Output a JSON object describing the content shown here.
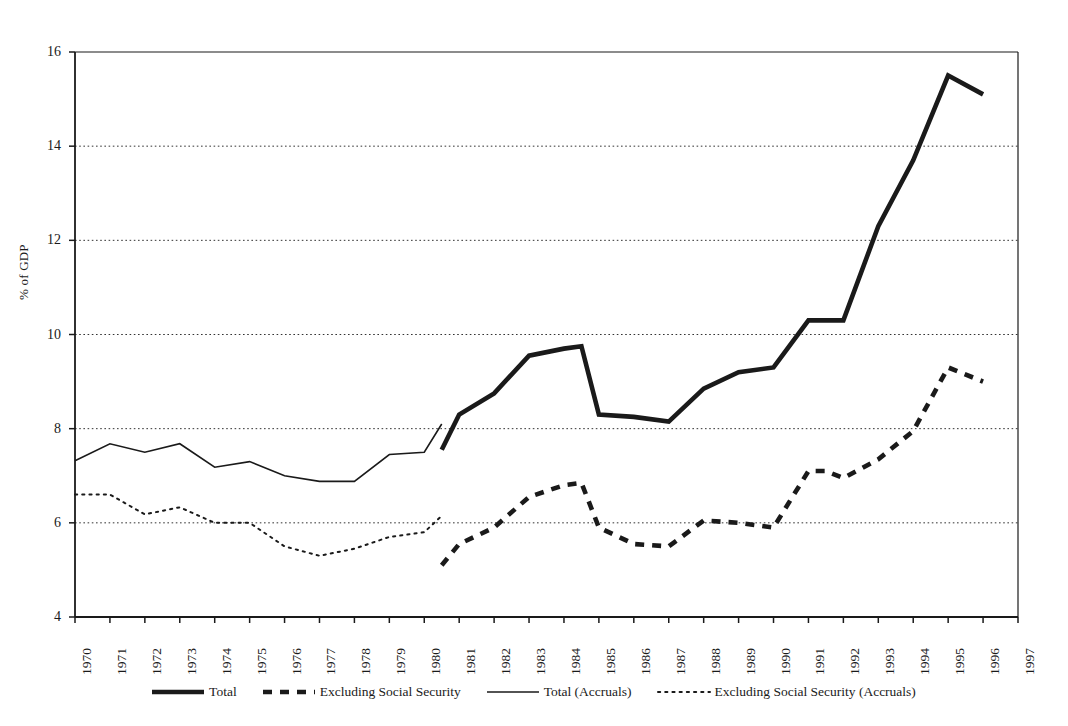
{
  "chart_data": {
    "type": "line",
    "title": "",
    "xlabel": "",
    "ylabel": "% of GDP",
    "xlim": [
      1970,
      1997
    ],
    "ylim": [
      4,
      16
    ],
    "yticks": [
      4,
      6,
      8,
      10,
      12,
      14,
      16
    ],
    "xticks": [
      1970,
      1971,
      1972,
      1973,
      1974,
      1975,
      1976,
      1977,
      1978,
      1979,
      1980,
      1981,
      1982,
      1983,
      1984,
      1985,
      1986,
      1987,
      1988,
      1989,
      1990,
      1991,
      1992,
      1993,
      1994,
      1995,
      1996,
      1997
    ],
    "grid": "horizontal-dotted",
    "legend_position": "bottom",
    "series": [
      {
        "name": "Total",
        "style": "thick-solid",
        "color": "#1a1a1a",
        "x": [
          1980.5,
          1981,
          1982,
          1983,
          1984,
          1984.5,
          1985,
          1986,
          1987,
          1988,
          1989,
          1990,
          1991,
          1991.5,
          1992,
          1993,
          1994,
          1995,
          1996
        ],
        "y": [
          7.55,
          8.3,
          8.75,
          9.55,
          9.7,
          9.75,
          8.3,
          8.25,
          8.15,
          8.85,
          9.2,
          9.3,
          10.3,
          10.3,
          10.3,
          12.3,
          13.7,
          15.5,
          15.1
        ]
      },
      {
        "name": "Excluding Social Security",
        "style": "thick-dashed",
        "color": "#1a1a1a",
        "x": [
          1980.5,
          1981,
          1982,
          1983,
          1984,
          1984.5,
          1985,
          1986,
          1987,
          1988,
          1989,
          1990,
          1991,
          1991.5,
          1992,
          1993,
          1994,
          1995,
          1996
        ],
        "y": [
          5.1,
          5.55,
          5.9,
          6.55,
          6.8,
          6.85,
          5.9,
          5.55,
          5.5,
          6.05,
          6.0,
          5.9,
          7.1,
          7.1,
          6.95,
          7.35,
          7.95,
          9.3,
          9.0
        ]
      },
      {
        "name": "Total (Accruals)",
        "style": "thin-solid",
        "color": "#1a1a1a",
        "x": [
          1970,
          1971,
          1972,
          1973,
          1974,
          1975,
          1976,
          1977,
          1978,
          1979,
          1980,
          1980.5
        ],
        "y": [
          7.32,
          7.68,
          7.5,
          7.68,
          7.18,
          7.3,
          7.0,
          6.88,
          6.88,
          7.45,
          7.5,
          8.1
        ]
      },
      {
        "name": "Excluding Social Security (Accruals)",
        "style": "thin-dotted",
        "color": "#1a1a1a",
        "x": [
          1970,
          1971,
          1972,
          1973,
          1974,
          1975,
          1976,
          1977,
          1978,
          1979,
          1980,
          1980.5
        ],
        "y": [
          6.6,
          6.6,
          6.18,
          6.33,
          6.0,
          6.0,
          5.5,
          5.3,
          5.45,
          5.7,
          5.8,
          6.15
        ]
      }
    ]
  },
  "legend": {
    "items": [
      {
        "label": "Total",
        "style": "thick-solid"
      },
      {
        "label": "Excluding Social Security",
        "style": "thick-dashed"
      },
      {
        "label": "Total (Accruals)",
        "style": "thin-solid"
      },
      {
        "label": "Excluding Social Security (Accruals)",
        "style": "thin-dotted"
      }
    ]
  },
  "axes": {
    "y_label": "% of GDP",
    "y_tick_labels": [
      "16",
      "14",
      "12",
      "10",
      "8",
      "6",
      "4"
    ],
    "x_tick_labels": [
      "1970",
      "1971",
      "1972",
      "1973",
      "1974",
      "1975",
      "1976",
      "1977",
      "1978",
      "1979",
      "1980",
      "1981",
      "1982",
      "1983",
      "1984",
      "1985",
      "1986",
      "1987",
      "1988",
      "1989",
      "1990",
      "1991",
      "1992",
      "1993",
      "1994",
      "1995",
      "1996",
      "1997"
    ]
  }
}
